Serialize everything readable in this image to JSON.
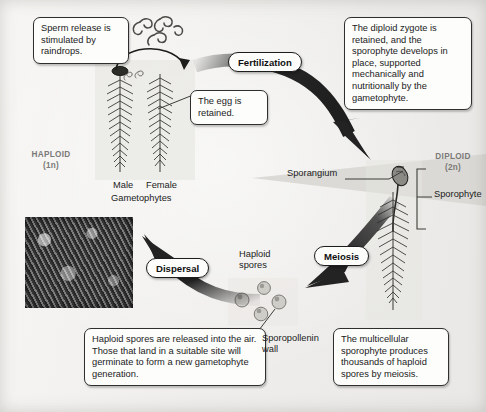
{
  "figure": {
    "background_color": "#f2f1ef"
  },
  "ploidy_labels": {
    "haploid": {
      "name": "HAPLOID",
      "value": "(1n)"
    },
    "diploid": {
      "name": "DIPLOID",
      "value": "(2n)"
    }
  },
  "stage_labels": {
    "fertilization": "Fertilization",
    "meiosis": "Meiosis",
    "dispersal": "Dispersal"
  },
  "callouts": {
    "sperm_release": "Sperm release is stimulated by raindrops.",
    "egg_retained": "The egg is retained.",
    "zygote_retained": "The diploid zygote is retained, and the sporophyte develops in place, supported mechanically and nutritionally by the gametophyte.",
    "spores_released": "Haploid spores are released into the air. Those that land in a suitable site will germinate to form a new gametophyte generation.",
    "sporophyte_produces": "The multicellular sporophyte produces thousands of haploid spores by meiosis."
  },
  "structure_labels": {
    "male": "Male",
    "female": "Female",
    "gametophytes": "Gametophytes",
    "sporangium": "Sporangium",
    "sporophyte": "Sporophyte",
    "haploid_spores_line1": "Haploid",
    "haploid_spores_line2": "spores",
    "sporopollenin_line1": "Sporopollenin",
    "sporopollenin_line2": "wall"
  },
  "icons": {
    "sperm": "sperm-cells-icon",
    "spore": "spore-icon",
    "moss_photo": "moss-field-photo",
    "gametophyte_male": "male-gametophyte-plant",
    "gametophyte_female": "female-gametophyte-plant",
    "sporophyte_plant": "sporophyte-plant"
  },
  "colors": {
    "arrow": "#262626",
    "callout_border": "#2f2f2f",
    "ploidy_text": "#7b7a77",
    "body_text": "#1b1b1b"
  }
}
